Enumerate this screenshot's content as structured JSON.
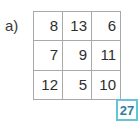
{
  "exercise": {
    "part_label": "a)"
  },
  "grid": {
    "rows": [
      [
        "8",
        "13",
        "6"
      ],
      [
        "7",
        "9",
        "11"
      ],
      [
        "12",
        "5",
        "10"
      ]
    ],
    "border_color": "#a9a9a9",
    "text_color": "#2e2e2e"
  },
  "badge": {
    "value": "27",
    "border_color": "#63c6d8",
    "text_color": "#2e7f9e",
    "background": "#ffffff"
  },
  "chart_data": {
    "type": "table",
    "title": "a)",
    "categories": [
      "col1",
      "col2",
      "col3"
    ],
    "series": [
      {
        "name": "row1",
        "values": [
          8,
          13,
          6
        ]
      },
      {
        "name": "row2",
        "values": [
          7,
          9,
          11
        ]
      },
      {
        "name": "row3",
        "values": [
          12,
          5,
          10
        ]
      }
    ],
    "annotations": [
      {
        "text": "27",
        "position": "bottom-right",
        "role": "answer-badge"
      }
    ],
    "grid": true,
    "xlabel": "",
    "ylabel": ""
  }
}
